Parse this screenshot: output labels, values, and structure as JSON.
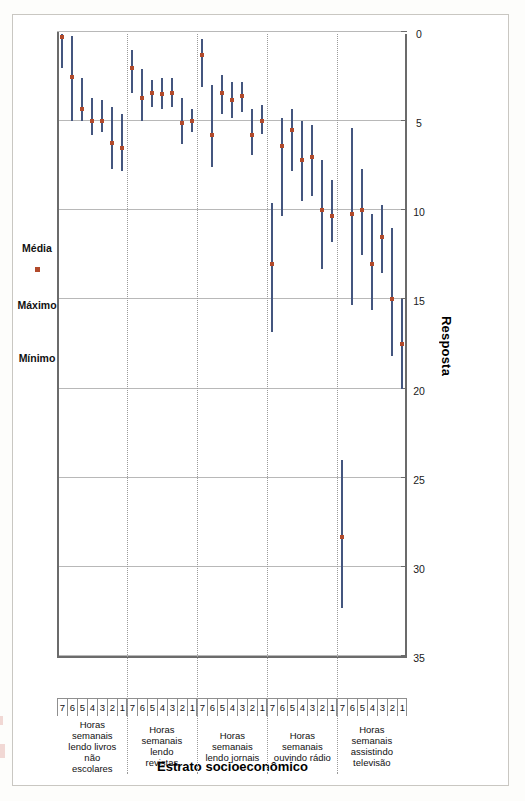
{
  "chart_data": {
    "type": "scatter",
    "title": "",
    "xlabel": "Estrato socioeconômico",
    "ylabel": "Resposta",
    "ylim": [
      0,
      35
    ],
    "yticks": [
      35,
      30,
      25,
      20,
      15,
      10,
      5,
      0
    ],
    "grid": true,
    "legend_position": "top",
    "legend": [
      {
        "label": "Mínimo",
        "marker": "line-end",
        "color": "#44567f"
      },
      {
        "label": "Máximo",
        "marker": "line-end",
        "color": "#44567f"
      },
      {
        "label": "Média",
        "marker": "square",
        "color": "#b24a2b"
      }
    ],
    "categories": [
      "1",
      "2",
      "3",
      "4",
      "5",
      "6",
      "7"
    ],
    "groups": [
      {
        "name": "Horas semanais assistindo televisão",
        "points": [
          {
            "estrato": "1",
            "minimo": 20.0,
            "maximo": 15.0,
            "media": 17.5
          },
          {
            "estrato": "2",
            "minimo": 18.2,
            "maximo": 11.0,
            "media": 15.0
          },
          {
            "estrato": "3",
            "minimo": 13.5,
            "maximo": 9.7,
            "media": 11.5
          },
          {
            "estrato": "4",
            "minimo": 15.6,
            "maximo": 10.2,
            "media": 13.0
          },
          {
            "estrato": "5",
            "minimo": 12.5,
            "maximo": 7.7,
            "media": 10.0
          },
          {
            "estrato": "6",
            "minimo": 15.3,
            "maximo": 5.4,
            "media": 10.2
          },
          {
            "estrato": "7",
            "minimo": 32.3,
            "maximo": 24.0,
            "media": 28.3
          }
        ]
      },
      {
        "name": "Horas semanais ouvindo rádio",
        "points": [
          {
            "estrato": "1",
            "minimo": 11.8,
            "maximo": 8.3,
            "media": 10.3
          },
          {
            "estrato": "2",
            "minimo": 13.3,
            "maximo": 7.2,
            "media": 10.0
          },
          {
            "estrato": "3",
            "minimo": 9.2,
            "maximo": 5.2,
            "media": 7.0
          },
          {
            "estrato": "4",
            "minimo": 9.5,
            "maximo": 5.0,
            "media": 7.2
          },
          {
            "estrato": "5",
            "minimo": 7.8,
            "maximo": 4.3,
            "media": 5.5
          },
          {
            "estrato": "6",
            "minimo": 10.3,
            "maximo": 4.8,
            "media": 6.4
          },
          {
            "estrato": "7",
            "minimo": 16.8,
            "maximo": 9.6,
            "media": 13.0
          }
        ]
      },
      {
        "name": "Horas semanais lendo jornais",
        "points": [
          {
            "estrato": "1",
            "minimo": 5.7,
            "maximo": 4.1,
            "media": 5.0
          },
          {
            "estrato": "2",
            "minimo": 6.9,
            "maximo": 4.3,
            "media": 5.8
          },
          {
            "estrato": "3",
            "minimo": 4.5,
            "maximo": 2.8,
            "media": 3.6
          },
          {
            "estrato": "4",
            "minimo": 4.8,
            "maximo": 2.8,
            "media": 3.8
          },
          {
            "estrato": "5",
            "minimo": 4.6,
            "maximo": 2.4,
            "media": 3.4
          },
          {
            "estrato": "6",
            "minimo": 7.6,
            "maximo": 3.0,
            "media": 5.8
          },
          {
            "estrato": "7",
            "minimo": 3.1,
            "maximo": 0.4,
            "media": 1.3
          }
        ]
      },
      {
        "name": "Horas semanais lendo revistas",
        "points": [
          {
            "estrato": "1",
            "minimo": 5.6,
            "maximo": 4.3,
            "media": 5.0
          },
          {
            "estrato": "2",
            "minimo": 6.3,
            "maximo": 3.7,
            "media": 5.1
          },
          {
            "estrato": "3",
            "minimo": 4.2,
            "maximo": 2.6,
            "media": 3.4
          },
          {
            "estrato": "4",
            "minimo": 4.3,
            "maximo": 2.6,
            "media": 3.5
          },
          {
            "estrato": "5",
            "minimo": 4.2,
            "maximo": 2.7,
            "media": 3.4
          },
          {
            "estrato": "6",
            "minimo": 5.0,
            "maximo": 2.1,
            "media": 3.7
          },
          {
            "estrato": "7",
            "minimo": 3.4,
            "maximo": 1.0,
            "media": 2.0
          }
        ]
      },
      {
        "name": "Horas semanais lendo livros não escolares",
        "points": [
          {
            "estrato": "1",
            "minimo": 7.8,
            "maximo": 4.6,
            "media": 6.5
          },
          {
            "estrato": "2",
            "minimo": 7.7,
            "maximo": 4.2,
            "media": 6.2
          },
          {
            "estrato": "3",
            "minimo": 5.6,
            "maximo": 3.8,
            "media": 5.0
          },
          {
            "estrato": "4",
            "minimo": 5.8,
            "maximo": 3.7,
            "media": 5.0
          },
          {
            "estrato": "5",
            "minimo": 5.0,
            "maximo": 2.6,
            "media": 4.3
          },
          {
            "estrato": "6",
            "minimo": 5.0,
            "maximo": 0.2,
            "media": 2.5
          },
          {
            "estrato": "7",
            "minimo": 2.0,
            "maximo": 0.1,
            "media": 0.3
          }
        ]
      }
    ]
  }
}
